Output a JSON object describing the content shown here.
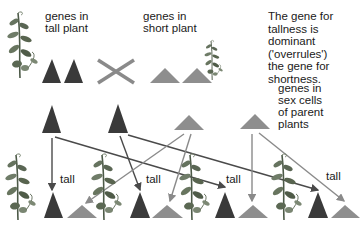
{
  "labels": {
    "tall_plant_genes": "genes in\ntall plant",
    "short_plant_genes": "genes in\nshort plant",
    "dominance_note": "The gene for\ntallness is\ndominant\n('overrules')\nthe gene for\nshortness.",
    "sex_cell_genes": "genes in\nsex cells\nof parent\nplants",
    "offspring": [
      "tall",
      "tall",
      "tall",
      "tall"
    ]
  },
  "colors": {
    "dominant_gene": "#3a3a3a",
    "recessive_gene": "#8e8e8e",
    "cross_mark": "#8a8a8a",
    "arrow_dark": "#4a4a4a",
    "arrow_light": "#8a8a8a",
    "plant_leaf": "#5f6b5a"
  },
  "legend": {
    "dark_triangle": "gene for tallness (dominant)",
    "light_triangle": "gene for shortness (recessive)"
  },
  "icons": [
    "tall-plant-icon",
    "short-plant-icon",
    "cross-icon",
    "offspring-plant-icon"
  ]
}
